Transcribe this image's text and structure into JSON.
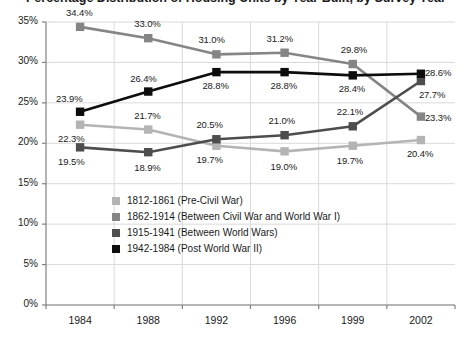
{
  "chart_data": {
    "type": "line",
    "title": "Percentage Distribution of Housing Units by Year Built, by Survey Year",
    "xlabel": "",
    "ylabel": "",
    "categories": [
      "1984",
      "1988",
      "1992",
      "1996",
      "1999",
      "2002"
    ],
    "ylim": [
      0,
      35
    ],
    "ytick_labels": [
      "0%",
      "5%",
      "10%",
      "15%",
      "20%",
      "25%",
      "30%",
      "35%"
    ],
    "ytick_values": [
      0,
      5,
      10,
      15,
      20,
      25,
      30,
      35
    ],
    "grid": true,
    "legend_position": "inside-lower-left",
    "series": [
      {
        "name": "1812-1861 (Pre-Civil War)",
        "color": "#b4b4b4",
        "values": [
          22.3,
          21.7,
          19.7,
          19.0,
          19.7,
          20.4
        ],
        "labels": [
          "22.3%",
          "21.7%",
          "19.7%",
          "19.0%",
          "19.7%",
          "20.4%"
        ]
      },
      {
        "name": "1862-1914 (Between Civil War and World War I)",
        "color": "#858585",
        "values": [
          34.4,
          33.0,
          31.0,
          31.2,
          29.8,
          23.3
        ],
        "labels": [
          "34.4%",
          "33.0%",
          "31.0%",
          "31.2%",
          "29.8%",
          "23.3%"
        ]
      },
      {
        "name": "1915-1941 (Between World Wars)",
        "color": "#4d4d4d",
        "values": [
          19.5,
          18.9,
          20.5,
          21.0,
          22.1,
          27.7
        ],
        "labels": [
          "19.5%",
          "18.9%",
          "20.5%",
          "21.0%",
          "22.1%",
          "27.7%"
        ]
      },
      {
        "name": "1942-1984 (Post World War II)",
        "color": "#0d0d0d",
        "values": [
          23.9,
          26.4,
          28.8,
          28.8,
          28.4,
          28.6
        ],
        "labels": [
          "23.9%",
          "26.4%",
          "28.8%",
          "28.8%",
          "28.4%",
          "28.6%"
        ]
      }
    ],
    "label_offsets": [
      [
        [
          -14,
          14
        ],
        [
          -6,
          -14
        ],
        [
          -12,
          14
        ],
        [
          -6,
          16
        ],
        [
          -8,
          15
        ],
        [
          -6,
          14
        ]
      ],
      [
        [
          -6,
          -14
        ],
        [
          -6,
          -14
        ],
        [
          -10,
          -14
        ],
        [
          -10,
          -14
        ],
        [
          -4,
          -14
        ],
        [
          12,
          1
        ]
      ],
      [
        [
          -14,
          15
        ],
        [
          -6,
          16
        ],
        [
          -12,
          -14
        ],
        [
          -8,
          -14
        ],
        [
          -8,
          -14
        ],
        [
          6,
          14
        ]
      ],
      [
        [
          -16,
          -13
        ],
        [
          -10,
          -13
        ],
        [
          -6,
          14
        ],
        [
          -6,
          14
        ],
        [
          -6,
          14
        ],
        [
          12,
          -1
        ]
      ]
    ]
  }
}
